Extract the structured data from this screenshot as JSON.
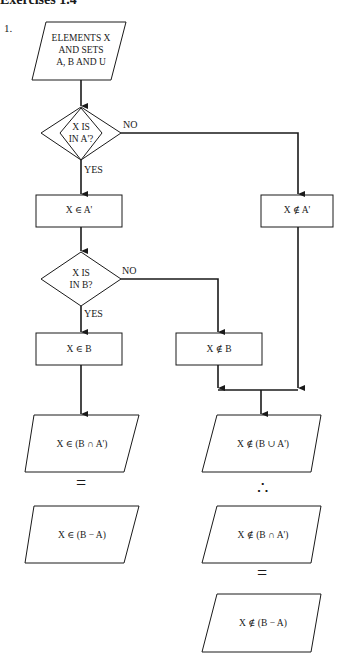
{
  "header": {
    "title": "Exercises 1.4",
    "exercise_number": "1."
  },
  "nodes": {
    "input": {
      "type": "parallelogram",
      "lines": [
        "ELEMENTS X",
        "AND SETS",
        "A, B AND U"
      ]
    },
    "decision1": {
      "type": "diamond",
      "lines": [
        "X IS",
        "IN A'?"
      ],
      "yes": "YES",
      "no": "NO"
    },
    "in_a_comp": {
      "type": "box",
      "text": "X ∈ A'"
    },
    "not_in_a_comp": {
      "type": "box",
      "text": "X ∉ A'"
    },
    "decision2": {
      "type": "diamond",
      "lines": [
        "X IS",
        "IN B?"
      ],
      "yes": "YES",
      "no": "NO"
    },
    "in_b": {
      "type": "box",
      "text": "X ∈ B"
    },
    "not_in_b": {
      "type": "box",
      "text": "X ∉ B"
    },
    "left_result1": {
      "type": "parallelogram",
      "text": "X ∈ (B ∩ A')"
    },
    "left_equals": "=",
    "left_result2": {
      "type": "parallelogram",
      "text": "X ∈ (B − A)"
    },
    "right_result1": {
      "type": "parallelogram",
      "text": "X ∉ (B ∪ A')"
    },
    "right_therefore": "∴",
    "right_result2": {
      "type": "parallelogram",
      "text": "X ∉ (B ∩ A')"
    },
    "right_equals": "=",
    "right_result3": {
      "type": "parallelogram",
      "text": "X ∉ (B − A)"
    }
  }
}
